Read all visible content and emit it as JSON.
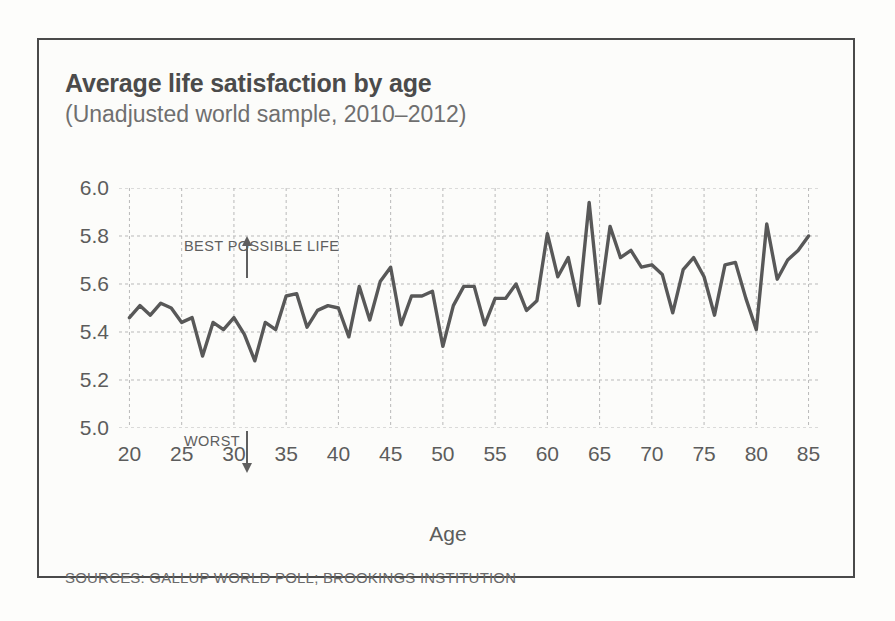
{
  "chart_data": {
    "type": "line",
    "title": "Average life satisfaction by age",
    "subtitle": "(Unadjusted world sample, 2010–2012)",
    "xlabel": "Age",
    "ylabel": "",
    "xlim": [
      19,
      86
    ],
    "ylim": [
      5.0,
      6.0
    ],
    "grid": true,
    "legend": null,
    "xticks": [
      20,
      25,
      30,
      35,
      40,
      45,
      50,
      55,
      60,
      65,
      70,
      75,
      80,
      85
    ],
    "yticks": [
      "5.0",
      "5.2",
      "5.4",
      "5.6",
      "5.8",
      "6.0"
    ],
    "line_color": "#585858",
    "annotations": [
      {
        "text": "BEST POSSIBLE LIFE",
        "arrow": "up",
        "at_y": 5.9
      },
      {
        "text": "WORST",
        "arrow": "down",
        "at_y": 5.08
      }
    ],
    "source": "SOURCES: GALLUP WORLD POLL; BROOKINGS INSTITUTION",
    "x": [
      20,
      21,
      22,
      23,
      24,
      25,
      26,
      27,
      28,
      29,
      30,
      31,
      32,
      33,
      34,
      35,
      36,
      37,
      38,
      39,
      40,
      41,
      42,
      43,
      44,
      45,
      46,
      47,
      48,
      49,
      50,
      51,
      52,
      53,
      54,
      55,
      56,
      57,
      58,
      59,
      60,
      61,
      62,
      63,
      64,
      65,
      66,
      67,
      68,
      69,
      70,
      71,
      72,
      73,
      74,
      75,
      76,
      77,
      78,
      79,
      80,
      81,
      82,
      83,
      84,
      85
    ],
    "values": [
      5.46,
      5.51,
      5.47,
      5.52,
      5.5,
      5.44,
      5.46,
      5.3,
      5.44,
      5.41,
      5.46,
      5.39,
      5.28,
      5.44,
      5.41,
      5.55,
      5.56,
      5.42,
      5.49,
      5.51,
      5.5,
      5.38,
      5.59,
      5.45,
      5.61,
      5.67,
      5.43,
      5.55,
      5.55,
      5.57,
      5.34,
      5.51,
      5.59,
      5.59,
      5.43,
      5.54,
      5.54,
      5.6,
      5.49,
      5.53,
      5.81,
      5.63,
      5.71,
      5.51,
      5.94,
      5.52,
      5.84,
      5.71,
      5.74,
      5.67,
      5.68,
      5.64,
      5.48,
      5.66,
      5.71,
      5.63,
      5.47,
      5.68,
      5.69,
      5.54,
      5.41,
      5.85,
      5.62,
      5.7,
      5.74,
      5.8
    ]
  }
}
